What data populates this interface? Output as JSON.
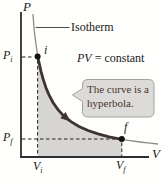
{
  "labels": {
    "y_axis": "P",
    "x_axis": "V",
    "isotherm": "Isotherm",
    "equation_italic": "PV",
    "equation_rest": "= constant",
    "point_initial": "i",
    "point_final": "f",
    "p_initial": {
      "base": "P",
      "sub": "i"
    },
    "p_final": {
      "base": "P",
      "sub": "f"
    },
    "v_initial": {
      "base": "V",
      "sub": "i"
    },
    "v_final": {
      "base": "V",
      "sub": "f"
    }
  },
  "callout": {
    "line1": "The curve is a",
    "line2": "hyperbola."
  },
  "colors": {
    "background": "#fefefc",
    "axis": "#2e2e2e",
    "curve_process_segment": "#3d3430",
    "curve_isotherm_thin": "#8b8b89",
    "shaded_area": "#d6d5d3",
    "dashed_line": "#222222",
    "point_marker": "#111111",
    "callout_fill": "#dcdbd9",
    "callout_border": "#a3a2a0",
    "callout_text": "#4a362e"
  },
  "chart": {
    "type": "line",
    "x_axis_label": "V",
    "y_axis_label": "P",
    "curve_label": "Isotherm",
    "equation": "PV = constant",
    "curve_shape": "hyperbola",
    "marked_points": [
      {
        "label": "i",
        "x": "Vi",
        "y": "Pi"
      },
      {
        "label": "f",
        "x": "Vf",
        "y": "Pf"
      }
    ],
    "annotation": "The curve is a hyperbola.",
    "shaded_region": "area under curve between Vi and Vf"
  }
}
